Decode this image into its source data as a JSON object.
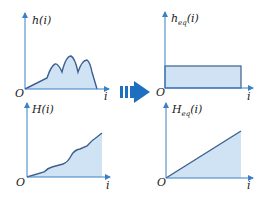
{
  "colors": {
    "axis": "#3b7fc4",
    "curve": "#3d5f8f",
    "fill": "#cfe3f5",
    "arrow": "#1f6fc0",
    "text": "#1a1a1a"
  },
  "panels": {
    "top_left": {
      "ylabel": "h(i)",
      "origin": "O",
      "xlabel": "i"
    },
    "top_right": {
      "ylabel_main": "h",
      "ylabel_sub": "eq",
      "ylabel_arg": "(i)",
      "origin": "O",
      "xlabel": "i"
    },
    "bottom_left": {
      "ylabel": "H(i)",
      "origin": "O",
      "xlabel": "i"
    },
    "bottom_right": {
      "ylabel_main": "H",
      "ylabel_sub": "eq",
      "ylabel_arg": "(i)",
      "origin": "O",
      "xlabel": "i"
    }
  },
  "arrow": {
    "icon": "right-arrow-icon"
  }
}
